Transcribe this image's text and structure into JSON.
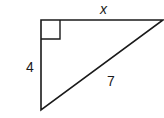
{
  "diagram": {
    "type": "right-triangle",
    "labels": {
      "top_side": "x",
      "left_side": "4",
      "hypotenuse": "7"
    },
    "right_angle_marker": "top-left",
    "stroke_color": "#1a1a1a"
  }
}
